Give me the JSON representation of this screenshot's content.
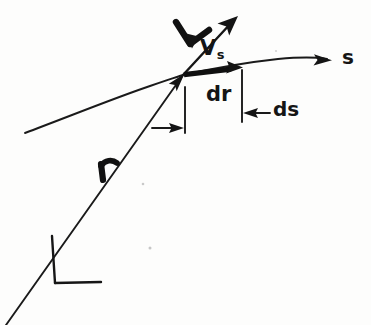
{
  "figure": {
    "kind": "hand-drawn kinematics diagram",
    "background_color": "#fdfdfc",
    "ink_color": "#151515",
    "width": 371,
    "height": 325,
    "labels": {
      "velocity_vector": "V",
      "speed_along_path": "V",
      "speed_along_path_subscript": "s",
      "differential_position": "d",
      "differential_position_vector": "r",
      "differential_arc_length": "ds",
      "arc_length_axis": "s",
      "position_vector": "r"
    },
    "elements": {
      "path_curve_name": "trajectory-curve",
      "velocity_arrow_name": "velocity-arrow",
      "dr_arrow_name": "dr-vector-arrow",
      "r_arrow_name": "position-vector-line",
      "axes_name": "coordinate-axes",
      "tick_left_name": "dimension-tick-left",
      "tick_right_name": "dimension-tick-right",
      "dr_dim_arrow_name": "dr-dimension-arrow",
      "ds_dim_arrow_name": "ds-dimension-arrow"
    },
    "geometry": {
      "tangent_point": [
        183,
        75
      ],
      "curve_start": [
        25,
        133
      ],
      "curve_end": [
        331,
        60
      ],
      "velocity_tip": [
        238,
        17
      ],
      "dr_tip": [
        241,
        68
      ],
      "origin": [
        56,
        283
      ],
      "tick_left_x": 185,
      "tick_right_x": 242
    }
  }
}
